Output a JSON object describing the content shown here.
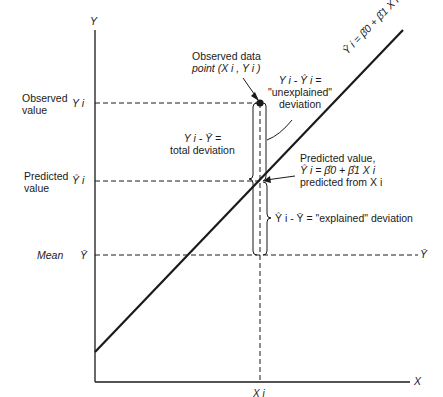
{
  "axes": {
    "y_label": "Y",
    "x_label": "X",
    "x_tick": "X i",
    "y_ticks": {
      "observed": "Y i",
      "predicted": "Ŷ i",
      "mean": "Ȳ"
    }
  },
  "left_labels": {
    "observed_line1": "Observed",
    "observed_line2": "value",
    "predicted_line1": "Predicted",
    "predicted_line2": "value",
    "mean": "Mean"
  },
  "annotations": {
    "observed_point_line1": "Observed data",
    "observed_point_line2": "point (X i , Y i )",
    "unexplained_line1": "Y i - Ŷ i =",
    "unexplained_line2": "\"unexplained\"",
    "unexplained_line3": "deviation",
    "total_line1": "Y i - Ȳ =",
    "total_line2": "total deviation",
    "predicted_line1": "Predicted value,",
    "predicted_line2": "Ŷ i = β̂0 + β̂1 X i",
    "predicted_line3": "predicted from X i",
    "explained": "Ŷ i - Ȳ = \"explained\" deviation",
    "mean_right": "Ȳ",
    "regression_line": "Ŷ i = β̂0 + β̂1 X i"
  },
  "colors": {
    "ink": "#1a1a1a",
    "background": "#ffffff"
  }
}
